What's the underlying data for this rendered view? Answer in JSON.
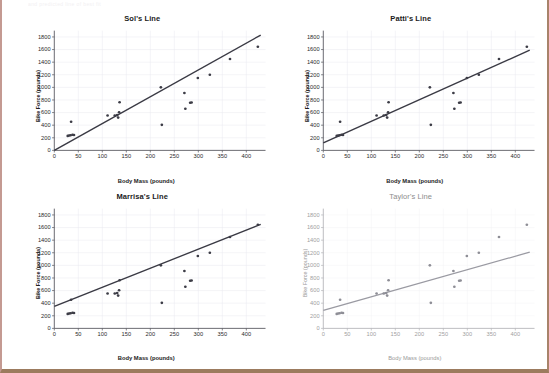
{
  "page": {
    "faint_header_text": "and predicted line of best fit",
    "border_color_left": "#c49a92",
    "border_color_right": "#a8836a",
    "border_color_bottom": "#9c7b5e",
    "background": "#ffffff"
  },
  "axes": {
    "xlabel": "Body Mass (pounds)",
    "ylabel": "Bike Force (pounds)",
    "xticks": [
      0,
      50,
      100,
      150,
      200,
      250,
      300,
      350,
      400
    ],
    "yticks": [
      0,
      200,
      400,
      600,
      800,
      1000,
      1200,
      1400,
      1600,
      1800
    ],
    "xlim": [
      0,
      440
    ],
    "ylim": [
      0,
      1900
    ]
  },
  "scatter_points": {
    "x": [
      28,
      31,
      34,
      38,
      41,
      35,
      111,
      126,
      131,
      133,
      135,
      136,
      222,
      224,
      271,
      273,
      283,
      286,
      299,
      324,
      366,
      424
    ],
    "y": [
      230,
      235,
      240,
      248,
      245,
      455,
      555,
      555,
      560,
      520,
      605,
      765,
      1000,
      405,
      910,
      660,
      755,
      760,
      1150,
      1200,
      1450,
      1645
    ]
  },
  "chart_data": [
    {
      "type": "scatter",
      "title": "Sol's Line",
      "xlabel": "Body Mass (pounds)",
      "ylabel": "Bike Force (pounds)",
      "xlim": [
        0,
        440
      ],
      "ylim": [
        0,
        1900
      ],
      "xticks": [
        0,
        50,
        100,
        150,
        200,
        250,
        300,
        350,
        400
      ],
      "yticks": [
        0,
        200,
        400,
        600,
        800,
        1000,
        1200,
        1400,
        1600,
        1800
      ],
      "grid": true,
      "legend": "none",
      "style": "bold",
      "x": [
        28,
        31,
        34,
        38,
        41,
        35,
        111,
        126,
        131,
        133,
        135,
        136,
        222,
        224,
        271,
        273,
        283,
        286,
        299,
        324,
        366,
        424
      ],
      "y": [
        230,
        235,
        240,
        248,
        245,
        455,
        555,
        555,
        560,
        520,
        605,
        765,
        1000,
        405,
        910,
        660,
        755,
        760,
        1150,
        1200,
        1450,
        1645
      ],
      "fit_line": {
        "intercept": 0,
        "slope": 4.25,
        "x_start": 0,
        "x_end": 430,
        "y_start": 0,
        "y_end": 1830
      }
    },
    {
      "type": "scatter",
      "title": "Patti's Line",
      "xlabel": "Body Mass (pounds)",
      "ylabel": "Bike Force (pounds)",
      "xlim": [
        0,
        440
      ],
      "ylim": [
        0,
        1900
      ],
      "xticks": [
        0,
        50,
        100,
        150,
        200,
        250,
        300,
        350,
        400
      ],
      "yticks": [
        0,
        200,
        400,
        600,
        800,
        1000,
        1200,
        1400,
        1600,
        1800
      ],
      "grid": true,
      "legend": "none",
      "style": "bold",
      "x": [
        28,
        31,
        34,
        38,
        41,
        35,
        111,
        126,
        131,
        133,
        135,
        136,
        222,
        224,
        271,
        273,
        283,
        286,
        299,
        324,
        366,
        424
      ],
      "y": [
        230,
        235,
        240,
        248,
        245,
        455,
        555,
        555,
        560,
        520,
        605,
        765,
        1000,
        405,
        910,
        660,
        755,
        760,
        1150,
        1200,
        1450,
        1645
      ],
      "fit_line": {
        "intercept": 120,
        "slope": 3.42,
        "x_start": 0,
        "x_end": 430,
        "y_start": 120,
        "y_end": 1590
      }
    },
    {
      "type": "scatter",
      "title": "Marrisa's Line",
      "xlabel": "Body Mass (pounds)",
      "ylabel": "Bike Force (pounds)",
      "xlim": [
        0,
        440
      ],
      "ylim": [
        0,
        1900
      ],
      "xticks": [
        0,
        50,
        100,
        150,
        200,
        250,
        300,
        350,
        400
      ],
      "yticks": [
        0,
        200,
        400,
        600,
        800,
        1000,
        1200,
        1400,
        1600,
        1800
      ],
      "grid": true,
      "legend": "none",
      "style": "bold",
      "x": [
        28,
        31,
        34,
        38,
        41,
        35,
        111,
        126,
        131,
        133,
        135,
        136,
        222,
        224,
        271,
        273,
        283,
        286,
        299,
        324,
        366,
        424
      ],
      "y": [
        230,
        235,
        240,
        248,
        245,
        455,
        555,
        555,
        560,
        520,
        605,
        765,
        1000,
        405,
        910,
        660,
        755,
        760,
        1150,
        1200,
        1450,
        1645
      ],
      "fit_line": {
        "intercept": 350,
        "slope": 3.02,
        "x_start": 0,
        "x_end": 430,
        "y_start": 350,
        "y_end": 1650
      }
    },
    {
      "type": "scatter",
      "title": "Taylor's Line",
      "xlabel": "Body Mass (pounds)",
      "ylabel": "Bike Force (pounds)",
      "xlim": [
        0,
        440
      ],
      "ylim": [
        0,
        1900
      ],
      "xticks": [
        0,
        50,
        100,
        150,
        200,
        250,
        300,
        350,
        400
      ],
      "yticks": [
        0,
        200,
        400,
        600,
        800,
        1000,
        1200,
        1400,
        1600,
        1800
      ],
      "grid": true,
      "legend": "none",
      "style": "faded",
      "x": [
        28,
        31,
        34,
        38,
        41,
        35,
        111,
        126,
        131,
        133,
        135,
        136,
        222,
        224,
        271,
        273,
        283,
        286,
        299,
        324,
        366,
        424
      ],
      "y": [
        230,
        235,
        240,
        248,
        245,
        455,
        555,
        555,
        560,
        520,
        605,
        765,
        1000,
        405,
        910,
        660,
        755,
        760,
        1150,
        1200,
        1450,
        1645
      ],
      "fit_line": {
        "intercept": 285,
        "slope": 2.15,
        "x_start": 0,
        "x_end": 430,
        "y_start": 285,
        "y_end": 1210
      }
    }
  ]
}
